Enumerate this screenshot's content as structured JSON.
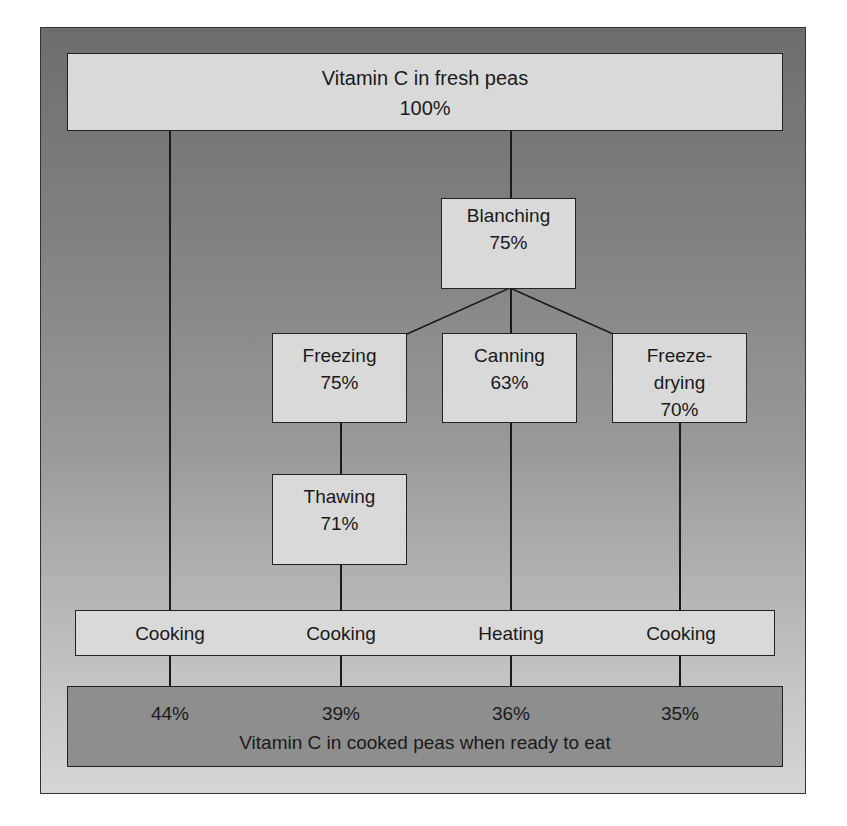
{
  "diagram": {
    "top": {
      "title": "Vitamin C in fresh peas",
      "value": "100%"
    },
    "blanching": {
      "label": "Blanching",
      "value": "75%"
    },
    "freezing": {
      "label": "Freezing",
      "value": "75%"
    },
    "canning": {
      "label": "Canning",
      "value": "63%"
    },
    "freeze_drying": {
      "label_line1": "Freeze-",
      "label_line2": "drying",
      "value": "70%"
    },
    "thawing": {
      "label": "Thawing",
      "value": "71%"
    },
    "final_steps": [
      "Cooking",
      "Cooking",
      "Heating",
      "Cooking"
    ],
    "results": [
      "44%",
      "39%",
      "36%",
      "35%"
    ],
    "bottom_caption": "Vitamin C in cooked peas when ready to eat"
  },
  "colors": {
    "box_fill": "#d9d9d9",
    "bottom_box_fill": "#8e8e8e",
    "frame_top": "#6e6e6e",
    "frame_bottom": "#d6d6d6",
    "line": "#1a1a1a"
  }
}
